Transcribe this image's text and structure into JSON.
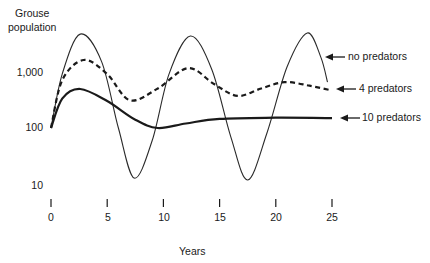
{
  "chart_data": {
    "type": "line",
    "title": "",
    "xlabel": "Years",
    "ylabel": "Grouse population",
    "yscale": "log",
    "ylim": [
      10,
      5000
    ],
    "xlim": [
      0,
      25
    ],
    "x_ticks": [
      "0",
      "5",
      "10",
      "15",
      "20",
      "25"
    ],
    "y_ticks": [
      "10",
      "100",
      "1,000"
    ],
    "grid": false,
    "legend_position": "right, arrow-annotated",
    "series": [
      {
        "name": "no predators",
        "style": "thin solid",
        "x": [
          0,
          1,
          2.6,
          4.5,
          6,
          7.4,
          9,
          10.5,
          12.4,
          14.3,
          16,
          17.5,
          19.2,
          21,
          22.8,
          24,
          24.6
        ],
        "values": [
          100,
          900,
          4600,
          1500,
          100,
          13,
          60,
          900,
          4250,
          1100,
          70,
          12,
          80,
          1200,
          4800,
          1800,
          650
        ]
      },
      {
        "name": "4 predators",
        "style": "thick dashed",
        "x": [
          0,
          1,
          2.9,
          5,
          7,
          9.5,
          12.2,
          14.5,
          16.6,
          18.7,
          20.8,
          23,
          24.8
        ],
        "values": [
          100,
          700,
          1600,
          900,
          310,
          500,
          1150,
          600,
          370,
          500,
          650,
          560,
          470
        ]
      },
      {
        "name": "10 predators",
        "style": "thick solid",
        "x": [
          0,
          1,
          2.6,
          5,
          7.5,
          9.5,
          12,
          15,
          20,
          25
        ],
        "values": [
          100,
          330,
          490,
          300,
          140,
          100,
          120,
          145,
          152,
          150
        ]
      }
    ],
    "annotations": [
      "no predators",
      "4 predators",
      "10 predators"
    ]
  },
  "labels": {
    "ylabel_line1": "Grouse",
    "ylabel_line2": "population",
    "xlabel": "Years",
    "yticks": [
      {
        "text": "1,000",
        "value": 1000
      },
      {
        "text": "100",
        "value": 100
      },
      {
        "text": "10",
        "value": 10
      }
    ],
    "xticks": [
      "0",
      "5",
      "10",
      "15",
      "20",
      "25"
    ],
    "legend": [
      "no predators",
      "4 predators",
      "10 predators"
    ]
  }
}
